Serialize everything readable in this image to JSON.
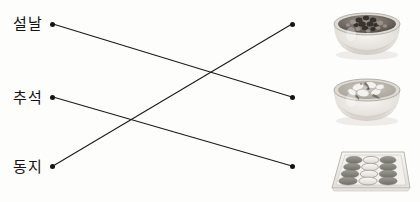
{
  "worksheet": {
    "type": "matching-line-exercise",
    "background_color": "#fdfdfc",
    "line_color": "#1a1a1a",
    "dot_color": "#141414",
    "text_color": "#15120f"
  },
  "left_column": {
    "items": [
      {
        "id": "seollal",
        "label": "설날",
        "dot_x": 52,
        "dot_y": 24
      },
      {
        "id": "chuseok",
        "label": "추석",
        "dot_x": 52,
        "dot_y": 97
      },
      {
        "id": "dongji",
        "label": "동지",
        "dot_x": 52,
        "dot_y": 166
      }
    ]
  },
  "right_column": {
    "items": [
      {
        "id": "patjuk",
        "image_name": "red-bean-porridge-bowl",
        "dot_x": 292,
        "dot_y": 24
      },
      {
        "id": "tteokguk",
        "image_name": "rice-cake-soup-bowl",
        "dot_x": 292,
        "dot_y": 97
      },
      {
        "id": "songpyeon",
        "image_name": "songpyeon-tray",
        "dot_x": 292,
        "dot_y": 166
      }
    ]
  },
  "connections": [
    {
      "from": "seollal",
      "to": "tteokguk",
      "x1": 53,
      "y1": 24,
      "x2": 292,
      "y2": 97
    },
    {
      "from": "chuseok",
      "to": "songpyeon",
      "x1": 53,
      "y1": 97,
      "x2": 292,
      "y2": 166
    },
    {
      "from": "dongji",
      "to": "patjuk",
      "x1": 53,
      "y1": 166,
      "x2": 292,
      "y2": 24
    }
  ],
  "colors": {
    "bowl_body": "#e9e6e1",
    "bowl_shade": "#c9c5bf",
    "bowl_rim": "#b7b3ad",
    "porridge_dark": "#4a4340",
    "porridge_mid": "#8d857e",
    "soup_broth": "#b9b4ad",
    "soup_rice_cake": "#f3f1ee",
    "tray_face": "#f0eeea",
    "songpyeon_dark": "#8b8b85",
    "songpyeon_light": "#f2f0ec"
  }
}
